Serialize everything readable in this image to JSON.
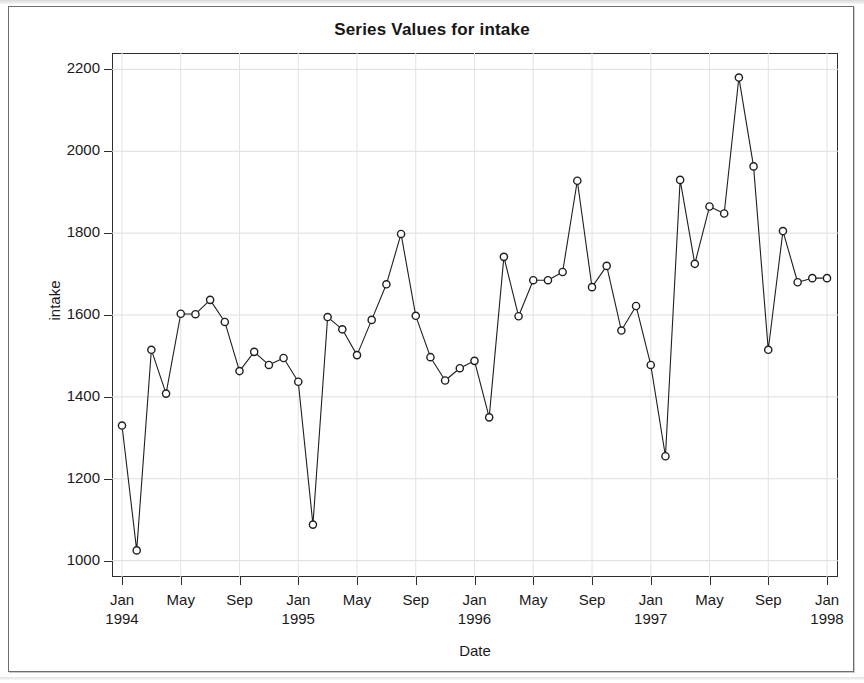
{
  "chart_data": {
    "type": "line",
    "title": "Series Values for intake",
    "xlabel": "Date",
    "ylabel": "intake",
    "grid": true,
    "legend": false,
    "marker": "open-circle",
    "line_color": "#1f1f1f",
    "marker_color": "#1f1f1f",
    "ylim": [
      960,
      2240
    ],
    "yticks": [
      1000,
      1200,
      1400,
      1600,
      1800,
      2000,
      2200
    ],
    "xticks": [
      {
        "month": "Jan",
        "year": "1994",
        "index": 0
      },
      {
        "month": "May",
        "year": "",
        "index": 4
      },
      {
        "month": "Sep",
        "year": "",
        "index": 8
      },
      {
        "month": "Jan",
        "year": "1995",
        "index": 12
      },
      {
        "month": "May",
        "year": "",
        "index": 16
      },
      {
        "month": "Sep",
        "year": "",
        "index": 20
      },
      {
        "month": "Jan",
        "year": "1996",
        "index": 24
      },
      {
        "month": "May",
        "year": "",
        "index": 28
      },
      {
        "month": "Sep",
        "year": "",
        "index": 32
      },
      {
        "month": "Jan",
        "year": "1997",
        "index": 36
      },
      {
        "month": "May",
        "year": "",
        "index": 40
      },
      {
        "month": "Sep",
        "year": "",
        "index": 44
      },
      {
        "month": "Jan",
        "year": "1998",
        "index": 48
      }
    ],
    "x": [
      "Jan 1994",
      "Feb 1994",
      "Mar 1994",
      "Apr 1994",
      "May 1994",
      "Jun 1994",
      "Jul 1994",
      "Aug 1994",
      "Sep 1994",
      "Oct 1994",
      "Nov 1994",
      "Dec 1994",
      "Jan 1995",
      "Feb 1995",
      "Mar 1995",
      "Apr 1995",
      "May 1995",
      "Jun 1995",
      "Jul 1995",
      "Aug 1995",
      "Sep 1995",
      "Oct 1995",
      "Nov 1995",
      "Dec 1995",
      "Jan 1996",
      "Feb 1996",
      "Mar 1996",
      "Apr 1996",
      "May 1996",
      "Jun 1996",
      "Jul 1996",
      "Aug 1996",
      "Sep 1996",
      "Oct 1996",
      "Nov 1996",
      "Dec 1996",
      "Jan 1997",
      "Feb 1997",
      "Mar 1997",
      "Apr 1997",
      "May 1997",
      "Jun 1997",
      "Jul 1997",
      "Aug 1997",
      "Sep 1997",
      "Oct 1997",
      "Nov 1997",
      "Dec 1997",
      "Jan 1998"
    ],
    "values": [
      1330,
      1025,
      1515,
      1408,
      1603,
      1602,
      1637,
      1583,
      1463,
      1510,
      1478,
      1495,
      1437,
      1088,
      1595,
      1565,
      1502,
      1588,
      1675,
      1798,
      1598,
      1497,
      1440,
      1470,
      1488,
      1350,
      1742,
      1597,
      1685,
      1685,
      1705,
      1928,
      1668,
      1720,
      1562,
      1622,
      1478,
      1255,
      1930,
      1725,
      1865,
      1848,
      2180,
      1963,
      1515,
      1805,
      1680,
      1690,
      1690
    ],
    "series_name": "intake"
  },
  "page": {
    "background": "#ffffff",
    "frame_color": "#6d6d6d"
  }
}
